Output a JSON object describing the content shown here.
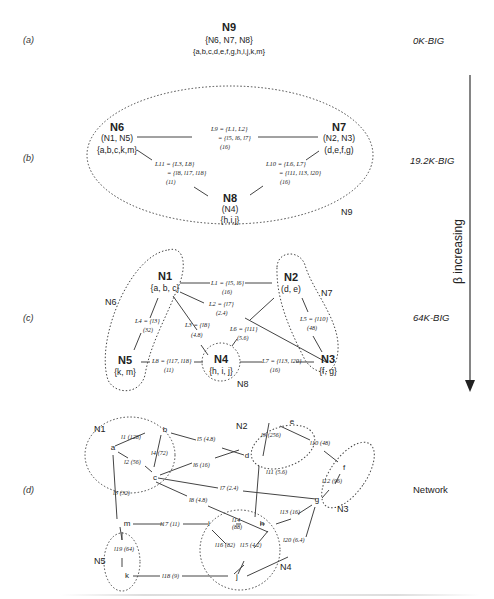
{
  "panels": {
    "a": {
      "label": "(a)",
      "level": "0K-BIG",
      "node": {
        "name": "N9",
        "children": "{N6, N7, N8}",
        "members": "{a,b,c,d,e,f,g,h,i,j,k,m}"
      }
    },
    "b": {
      "label": "(b)",
      "level": "19.2K-BIG",
      "cluster": "N9",
      "nodes": [
        {
          "name": "N6",
          "children": "(N1, N5)",
          "members": "{a,b,c,k,m}"
        },
        {
          "name": "N7",
          "children": "(N2, N3)",
          "members": "(d,e,f,g)"
        },
        {
          "name": "N8",
          "children": "(N4)",
          "members": "{h,i,j}"
        }
      ],
      "links": [
        {
          "id": "L9",
          "line1": "L9 = {L1, L2}",
          "line2": "= {l5, l6, l7}",
          "weight": "(16)"
        },
        {
          "id": "L11",
          "line1": "L11 = {L3, L8}",
          "line2": "= {l8, l17, l18}",
          "weight": "(11)"
        },
        {
          "id": "L10",
          "line1": "L10 = {L6, L7}",
          "line2": "= {l11, l13, l20}",
          "weight": "(16)"
        }
      ]
    },
    "c": {
      "label": "(c)",
      "level": "64K-BIG",
      "clusters": [
        "N6",
        "N7",
        "N8"
      ],
      "nodes": [
        {
          "name": "N1",
          "members": "{a, b, c}"
        },
        {
          "name": "N2",
          "members": "(d, e)"
        },
        {
          "name": "N3",
          "members": "{f, g}"
        },
        {
          "name": "N4",
          "members": "{h, i, j}"
        },
        {
          "name": "N5",
          "members": "{k, m}"
        }
      ],
      "links": [
        {
          "id": "L1",
          "text": "L1 = {l5, l6}",
          "weight": "(16)"
        },
        {
          "id": "L2",
          "text": "L2 = {l7}",
          "weight": "(2.4)"
        },
        {
          "id": "L3",
          "text": "L3 = {l8}",
          "weight": "(4.8)"
        },
        {
          "id": "L4",
          "text": "L4 = {l3}",
          "weight": "(32)"
        },
        {
          "id": "L5",
          "text": "L5 = {l10}",
          "weight": "(48)"
        },
        {
          "id": "L6",
          "text": "L6 = {l11}",
          "weight": "(5.6)"
        },
        {
          "id": "L7",
          "text": "L7 = {l13, l20}",
          "weight": "(16)"
        },
        {
          "id": "L8",
          "text": "L8 = {l17, l18}",
          "weight": "(11)"
        }
      ]
    },
    "d": {
      "label": "(d)",
      "level": "Network",
      "clusters": [
        "N1",
        "N2",
        "N3",
        "N4",
        "N5"
      ],
      "nodes": [
        "a",
        "b",
        "c",
        "d",
        "e",
        "f",
        "g",
        "h",
        "i",
        "j",
        "k",
        "m"
      ],
      "links": [
        {
          "id": "l1",
          "weight": "(128)"
        },
        {
          "id": "l2",
          "weight": "(56)"
        },
        {
          "id": "l3",
          "weight": "(32)"
        },
        {
          "id": "l4",
          "weight": "(72)"
        },
        {
          "id": "l5",
          "weight": "(4.8)"
        },
        {
          "id": "l6",
          "weight": "(16)"
        },
        {
          "id": "l7",
          "weight": "(2.4)"
        },
        {
          "id": "l8",
          "weight": "(4.8)"
        },
        {
          "id": "l9",
          "weight": "(256)"
        },
        {
          "id": "l10",
          "weight": "(48)"
        },
        {
          "id": "l11",
          "weight": "(5.6)"
        },
        {
          "id": "l12",
          "weight": "(96)"
        },
        {
          "id": "l13",
          "weight": "(16)"
        },
        {
          "id": "l14",
          "weight": "(88)"
        },
        {
          "id": "l15",
          "weight": "(4.2)"
        },
        {
          "id": "l16",
          "weight": "(82)"
        },
        {
          "id": "l17",
          "weight": "(11)"
        },
        {
          "id": "l18",
          "weight": "(9)"
        },
        {
          "id": "l19",
          "weight": "(64)"
        },
        {
          "id": "l20",
          "weight": "(6.4)"
        }
      ]
    }
  },
  "axis": {
    "label": "β increasing"
  }
}
